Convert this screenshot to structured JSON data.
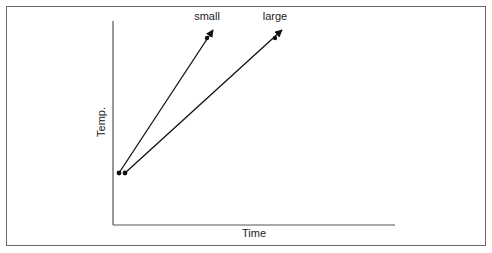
{
  "diagram": {
    "axes": {
      "x_label": "Time",
      "y_label": "Temp."
    },
    "lines": [
      {
        "label": "small",
        "start": [
          119,
          173
        ],
        "mid_dot": [
          207,
          38
        ],
        "end": [
          213,
          30
        ]
      },
      {
        "label": "large",
        "start": [
          125,
          173
        ],
        "mid_dot": [
          275,
          38
        ],
        "end": [
          282,
          30
        ]
      }
    ],
    "colors": {
      "frame": "#6a6a6a",
      "axis": "#555555",
      "line": "#111111"
    }
  }
}
